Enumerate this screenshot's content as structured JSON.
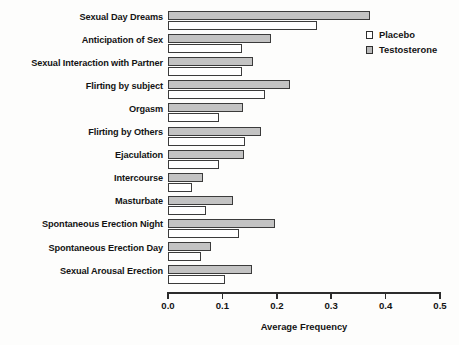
{
  "chart_data": {
    "type": "bar",
    "orientation": "horizontal",
    "title": "",
    "xlabel": "Average Frequency",
    "ylabel": "",
    "xlim": [
      0.0,
      0.5
    ],
    "xticks": [
      "0.0",
      "0.1",
      "0.2",
      "0.3",
      "0.4",
      "0.5"
    ],
    "xtick_values": [
      0.0,
      0.1,
      0.2,
      0.3,
      0.4,
      0.5
    ],
    "grid": false,
    "legend_position": "top-right",
    "categories": [
      "Sexual Day Dreams",
      "Anticipation of Sex",
      "Sexual Interaction with Partner",
      "Flirting by subject",
      "Orgasm",
      "Flirting by Others",
      "Ejaculation",
      "Intercourse",
      "Masturbate",
      "Spontaneous Erection Night",
      "Spontaneous Erection Day",
      "Sexual Arousal Erection"
    ],
    "series": [
      {
        "name": "Testosterone",
        "color": "#c3c3c3",
        "values": [
          0.371,
          0.19,
          0.157,
          0.225,
          0.138,
          0.171,
          0.14,
          0.064,
          0.12,
          0.197,
          0.079,
          0.154
        ]
      },
      {
        "name": "Placebo",
        "color": "#ffffff",
        "values": [
          0.274,
          0.136,
          0.136,
          0.178,
          0.094,
          0.142,
          0.093,
          0.045,
          0.069,
          0.13,
          0.06,
          0.104
        ]
      }
    ]
  },
  "legend": {
    "entries": [
      {
        "label": "Placebo",
        "swatch": "open-square-icon"
      },
      {
        "label": "Testosterone",
        "swatch": "filled-square-icon"
      }
    ]
  },
  "axis": {
    "x_title": "Average Frequency"
  }
}
